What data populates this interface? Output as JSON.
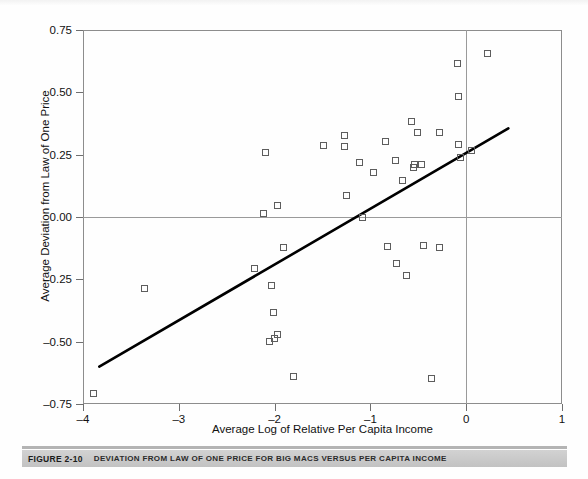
{
  "figure": {
    "caption_number": "FIGURE 2-10",
    "caption_text": "DEVIATION FROM LAW OF ONE PRICE FOR BIG MACS VERSUS PER CAPITA INCOME"
  },
  "chart_data": {
    "type": "scatter",
    "title": "",
    "xlabel": "Average Log of Relative Per Capita Income",
    "ylabel": "Average Deviation from Law of One Price",
    "xlim": [
      -4,
      1
    ],
    "ylim": [
      -0.75,
      0.75
    ],
    "xticks": [
      -4,
      -3,
      -2,
      -1,
      0,
      1
    ],
    "xticklabels": [
      "–4",
      "–3",
      "–2",
      "–1",
      "0",
      "1"
    ],
    "yticks": [
      0.75,
      0.5,
      0.25,
      0,
      -0.25,
      -0.5,
      -0.75
    ],
    "yticklabels": [
      "0.75",
      "0.50",
      "0.25",
      "0.00",
      "–0.25",
      "–0.50",
      "–0.75"
    ],
    "grid": false,
    "legend": null,
    "marker": "open-square",
    "marker_color": "#5d5d5d",
    "reference_lines": [
      {
        "name": "y-zero-line",
        "orientation": "horizontal",
        "value": 0,
        "color": "#9a9a9a"
      },
      {
        "name": "x-zero-line",
        "orientation": "vertical",
        "value": 0,
        "color": "#9a9a9a"
      }
    ],
    "trend_line": {
      "name": "regression-line",
      "x": [
        -3.83,
        0.44
      ],
      "y": [
        -0.6,
        0.355
      ],
      "color": "#000000",
      "width": 2.6
    },
    "points": [
      {
        "x": -3.88,
        "y": -0.71
      },
      {
        "x": -3.35,
        "y": -0.29
      },
      {
        "x": -2.2,
        "y": -0.21
      },
      {
        "x": -2.09,
        "y": 0.255
      },
      {
        "x": -2.11,
        "y": 0.012
      },
      {
        "x": -1.96,
        "y": 0.045
      },
      {
        "x": -2.05,
        "y": -0.5
      },
      {
        "x": -2.03,
        "y": -0.275
      },
      {
        "x": -2.01,
        "y": -0.385
      },
      {
        "x": -2.0,
        "y": -0.49
      },
      {
        "x": -1.96,
        "y": -0.475
      },
      {
        "x": -1.9,
        "y": -0.125
      },
      {
        "x": -1.8,
        "y": -0.64
      },
      {
        "x": -1.48,
        "y": 0.285
      },
      {
        "x": -1.27,
        "y": 0.325
      },
      {
        "x": -1.27,
        "y": 0.28
      },
      {
        "x": -1.24,
        "y": 0.085
      },
      {
        "x": -1.11,
        "y": 0.215
      },
      {
        "x": -1.08,
        "y": -0.005
      },
      {
        "x": -0.96,
        "y": 0.175
      },
      {
        "x": -0.84,
        "y": 0.3
      },
      {
        "x": -0.82,
        "y": -0.12
      },
      {
        "x": -0.73,
        "y": 0.225
      },
      {
        "x": -0.72,
        "y": -0.19
      },
      {
        "x": -0.66,
        "y": 0.145
      },
      {
        "x": -0.62,
        "y": -0.235
      },
      {
        "x": -0.57,
        "y": 0.38
      },
      {
        "x": -0.55,
        "y": 0.195
      },
      {
        "x": -0.5,
        "y": 0.335
      },
      {
        "x": -0.53,
        "y": 0.21
      },
      {
        "x": -0.46,
        "y": 0.21
      },
      {
        "x": -0.44,
        "y": -0.115
      },
      {
        "x": -0.36,
        "y": -0.65
      },
      {
        "x": -0.27,
        "y": 0.335
      },
      {
        "x": -0.27,
        "y": -0.125
      },
      {
        "x": -0.09,
        "y": 0.615
      },
      {
        "x": -0.08,
        "y": 0.48
      },
      {
        "x": -0.07,
        "y": 0.29
      },
      {
        "x": -0.05,
        "y": 0.235
      },
      {
        "x": 0.06,
        "y": 0.265
      },
      {
        "x": 0.23,
        "y": 0.655
      }
    ]
  }
}
